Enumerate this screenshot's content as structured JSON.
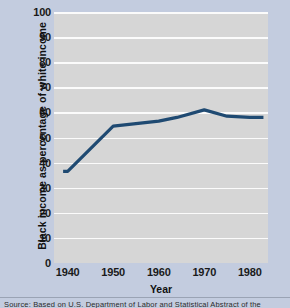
{
  "chart_data": {
    "type": "line",
    "title": "",
    "xlabel": "Year",
    "ylabel": "Black income as  percentage of white income",
    "xlim": [
      1937,
      1984
    ],
    "ylim": [
      0,
      100
    ],
    "grid": true,
    "legend": "none",
    "x_ticks": [
      1940,
      1950,
      1960,
      1970,
      1980
    ],
    "y_ticks": [
      0,
      10,
      20,
      30,
      40,
      50,
      60,
      70,
      80,
      90,
      100
    ],
    "series": [
      {
        "name": "Black income as percentage of white income",
        "color": "#1f4a72",
        "x": [
          1939,
          1940,
          1950,
          1960,
          1964,
          1970,
          1975,
          1980,
          1983
        ],
        "values": [
          36.5,
          36.5,
          54.5,
          56.5,
          58,
          61,
          58.5,
          58,
          58
        ]
      }
    ]
  },
  "axes": {
    "y_title": "Black income as  percentage of white income",
    "x_title": "Year",
    "y_tick_labels": [
      "100",
      "90",
      "80",
      "70",
      "60",
      "50",
      "40",
      "30",
      "20",
      "10",
      "0"
    ],
    "x_tick_labels": [
      "1940",
      "1950",
      "1960",
      "1970",
      "1980"
    ]
  },
  "source": {
    "note": "Source:  Based on U.S. Department of Labor and Statistical Abstract of the"
  },
  "colors": {
    "figure_background": "#c3ccdf",
    "plot_background": "#d6d6d6",
    "gridline": "#fbfbfb",
    "line": "#1f4a72",
    "text": "#111111"
  }
}
